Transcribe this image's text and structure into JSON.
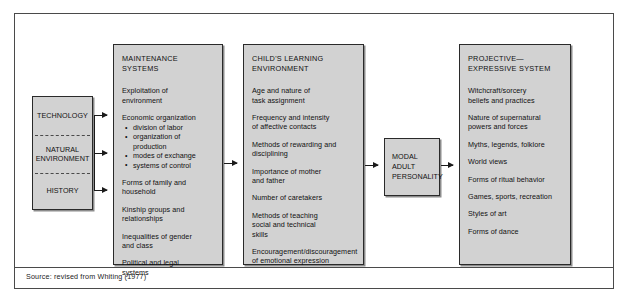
{
  "figure": {
    "source_note": "Source: revised from Whiting (1977)"
  },
  "inputs_box": {
    "name": "environmental-inputs",
    "cells": [
      {
        "label": "TECHNOLOGY"
      },
      {
        "label": "NATURAL\nENVIRONMENT"
      },
      {
        "label": "HISTORY"
      }
    ]
  },
  "maintenance_box": {
    "title": "MAINTENANCE SYSTEMS",
    "items": [
      "Exploitation of\n   environment",
      "Economic organization"
    ],
    "bullets": [
      "division of labor",
      "organization of production",
      "modes of exchange",
      "systems of control"
    ],
    "items_after": [
      "Forms of family and\n   household",
      "Kinship groups and\n   relationships",
      "Inequalities of gender\n   and class",
      "Political and legal\n   systems"
    ]
  },
  "child_box": {
    "title": "CHILD'S LEARNING\n   ENVIRONMENT",
    "items": [
      "Age and nature of\n   task assignment",
      "Frequency and intensity\n   of affective contacts",
      "Methods of rewarding and\n   disciplining",
      "Importance of mother\n   and father",
      "Number of caretakers",
      "Methods of teaching\n   social and technical\n   skills",
      "Encouragement/discouragement\n   of emotional expression"
    ]
  },
  "modal_box": {
    "label": "MODAL\nADULT\nPERSONALITY"
  },
  "projective_box": {
    "title": "PROJECTIVE—\nEXPRESSIVE SYSTEM",
    "items": [
      "Witchcraft/sorcery\n   beliefs and practices",
      "Nature of supernatural\n   powers and forces",
      "Myths, legends, folklore",
      "World views",
      "Forms of ritual behavior",
      "Games, sports, recreation",
      "Styles of art",
      "Forms of dance"
    ]
  },
  "arrows": [
    {
      "name": "arrow-technology-to-maintenance"
    },
    {
      "name": "arrow-environment-to-maintenance"
    },
    {
      "name": "arrow-history-to-maintenance"
    },
    {
      "name": "arrow-maintenance-to-child"
    },
    {
      "name": "arrow-child-to-modal"
    },
    {
      "name": "arrow-modal-to-projective"
    }
  ],
  "colors": {
    "box_fill": "#d2d2d2",
    "box_border": "#2a2a2a",
    "frame": "#4a4a4a",
    "text": "#111111"
  }
}
